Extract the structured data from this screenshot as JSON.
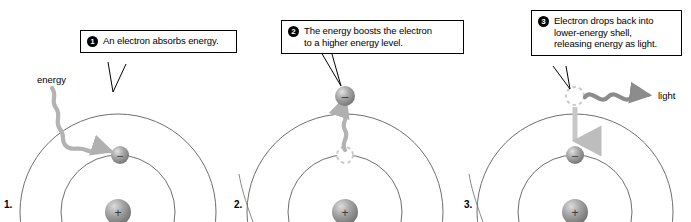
{
  "figure": {
    "background_color": "#ffffff",
    "width": 691,
    "height": 222
  },
  "colors": {
    "shell_stroke": "#6e6e6e",
    "divider_stroke": "#8a8a8a",
    "electron_fill": "#8f8f8f",
    "electron_highlight": "#d8d8d8",
    "nucleus_fill": "#9a9a9a",
    "nucleus_highlight": "#d5d5d5",
    "wave_arrow": "#b3b3b3",
    "straight_arrow": "#bdbdbd",
    "light_wave": "#8c8c8c",
    "ghost_outline": "#c9c9c9",
    "leader_line": "#000000",
    "callout_border": "#000000",
    "text": "#000000"
  },
  "panels": [
    {
      "number": "1.",
      "callout": {
        "badge": "1",
        "lines": [
          "An electron absorbs energy."
        ]
      },
      "labels": {
        "energy": "energy"
      },
      "electron_symbol": "–",
      "nucleus_symbol": "+"
    },
    {
      "number": "2.",
      "callout": {
        "badge": "2",
        "lines": [
          "The energy boosts the electron",
          "to a higher energy level."
        ]
      },
      "electron_symbol": "–",
      "nucleus_symbol": "+"
    },
    {
      "number": "3.",
      "callout": {
        "badge": "3",
        "lines": [
          "Electron drops back into",
          "lower-energy shell,",
          "releasing energy as light."
        ]
      },
      "labels": {
        "light": "light"
      },
      "electron_symbol": "–",
      "nucleus_symbol": "+"
    }
  ]
}
